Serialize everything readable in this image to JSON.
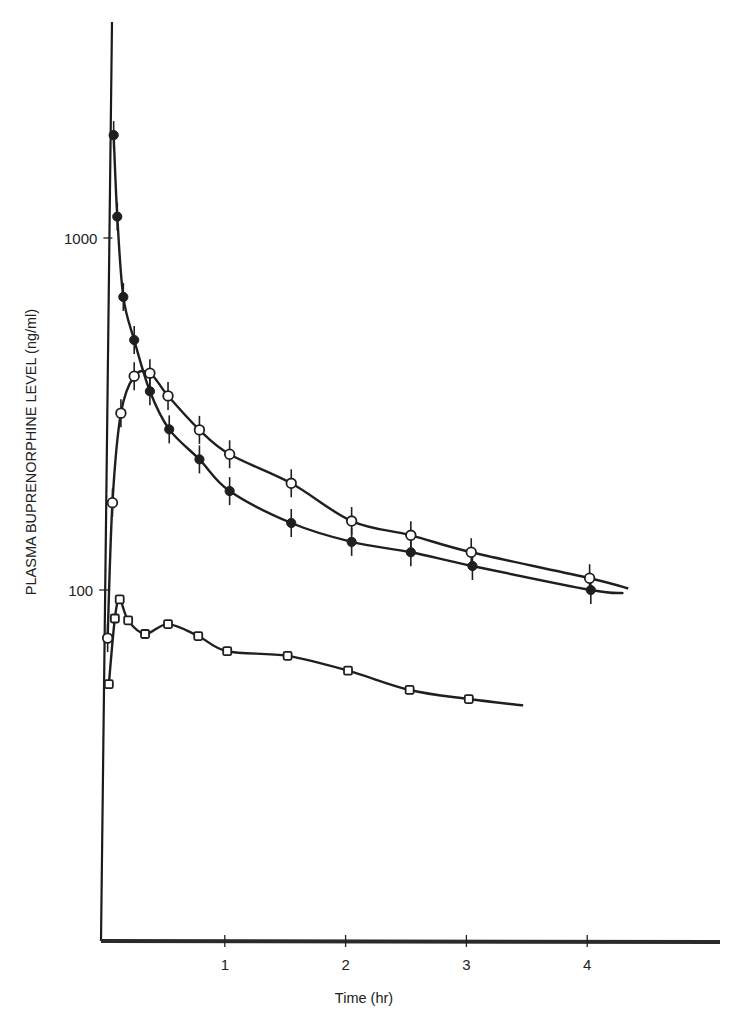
{
  "chart_data": {
    "type": "line",
    "title": "",
    "xlabel": "Time (hr)",
    "ylabel": "PLASMA BUPRENORPHINE LEVEL (ng/ml)",
    "yscale": "log",
    "xlim": [
      0,
      5.1
    ],
    "ylim": [
      10,
      5000
    ],
    "x_ticks": [
      1,
      2,
      3,
      4
    ],
    "x_tick_labels": [
      "1",
      "2",
      "3",
      "4"
    ],
    "y_ticks": [
      100,
      1000
    ],
    "y_tick_labels": [
      "100",
      "1000"
    ],
    "grid": false,
    "legend": null,
    "series": [
      {
        "name": "filled circles",
        "marker": "filled-circle",
        "error_bars": true,
        "points": [
          {
            "x": 0.08,
            "y": 1960
          },
          {
            "x": 0.11,
            "y": 1150
          },
          {
            "x": 0.16,
            "y": 680
          },
          {
            "x": 0.25,
            "y": 513
          },
          {
            "x": 0.38,
            "y": 367
          },
          {
            "x": 0.54,
            "y": 286
          },
          {
            "x": 0.79,
            "y": 235
          },
          {
            "x": 1.04,
            "y": 191
          },
          {
            "x": 1.55,
            "y": 155
          },
          {
            "x": 2.05,
            "y": 137
          },
          {
            "x": 2.54,
            "y": 128
          },
          {
            "x": 3.05,
            "y": 117
          },
          {
            "x": 4.03,
            "y": 100
          }
        ],
        "curve_end": {
          "x": 4.3,
          "y": 98
        }
      },
      {
        "name": "open circles",
        "marker": "open-circle",
        "error_bars": true,
        "points": [
          {
            "x": 0.03,
            "y": 73
          },
          {
            "x": 0.07,
            "y": 177
          },
          {
            "x": 0.14,
            "y": 318
          },
          {
            "x": 0.25,
            "y": 405
          },
          {
            "x": 0.38,
            "y": 413
          },
          {
            "x": 0.53,
            "y": 356
          },
          {
            "x": 0.79,
            "y": 285
          },
          {
            "x": 1.04,
            "y": 243
          },
          {
            "x": 1.55,
            "y": 201
          },
          {
            "x": 2.05,
            "y": 157
          },
          {
            "x": 2.54,
            "y": 143
          },
          {
            "x": 3.04,
            "y": 128
          },
          {
            "x": 4.02,
            "y": 108
          }
        ],
        "curve_end": {
          "x": 4.34,
          "y": 101
        }
      },
      {
        "name": "open squares",
        "marker": "open-square",
        "error_bars": false,
        "points": [
          {
            "x": 0.04,
            "y": 54
          },
          {
            "x": 0.09,
            "y": 83
          },
          {
            "x": 0.13,
            "y": 94
          },
          {
            "x": 0.2,
            "y": 82
          },
          {
            "x": 0.34,
            "y": 75
          },
          {
            "x": 0.53,
            "y": 80
          },
          {
            "x": 0.78,
            "y": 74
          },
          {
            "x": 1.02,
            "y": 67
          },
          {
            "x": 1.52,
            "y": 65
          },
          {
            "x": 2.02,
            "y": 59
          },
          {
            "x": 2.53,
            "y": 52
          },
          {
            "x": 3.02,
            "y": 49
          }
        ],
        "curve_end": {
          "x": 3.47,
          "y": 47
        }
      }
    ]
  }
}
